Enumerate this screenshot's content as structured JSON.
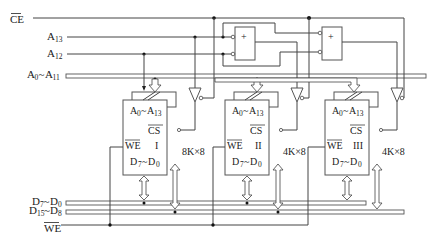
{
  "diagram": {
    "type": "memory-expansion-circuit",
    "signals": {
      "ce": "CE",
      "a13": {
        "base": "A",
        "sub": "13"
      },
      "a12": {
        "base": "A",
        "sub": "12"
      },
      "addr_bus": {
        "base1": "A",
        "sub1": "0",
        "sep": "~",
        "base2": "A",
        "sub2": "11"
      },
      "d_low": {
        "base1": "D",
        "sub1": "7",
        "sep": "~",
        "base2": "D",
        "sub2": "0"
      },
      "d_high": {
        "base1": "D",
        "sub1": "15",
        "sep": "~",
        "base2": "D",
        "sub2": "8"
      },
      "we": "WE"
    },
    "chips": [
      {
        "id": "I",
        "roman": "I",
        "size": "8K×8",
        "addr": {
          "b1": "A",
          "s1": "0",
          "sep": "~",
          "b2": "A",
          "s2": "13"
        },
        "cs": "CS",
        "we": "WE",
        "data": {
          "b1": "D",
          "s1": "7",
          "sep": "~",
          "b2": "D",
          "s2": "0"
        }
      },
      {
        "id": "II",
        "roman": "II",
        "size": "4K×8",
        "addr": {
          "b1": "A",
          "s1": "0",
          "sep": "~",
          "b2": "A",
          "s2": "13"
        },
        "cs": "CS",
        "we": "WE",
        "data": {
          "b1": "D",
          "s1": "7",
          "sep": "~",
          "b2": "D",
          "s2": "0"
        }
      },
      {
        "id": "III",
        "roman": "III",
        "size": "4K×8",
        "addr": {
          "b1": "A",
          "s1": "0",
          "sep": "~",
          "b2": "A",
          "s2": "13"
        },
        "cs": "CS",
        "we": "WE",
        "data": {
          "b1": "D",
          "s1": "7",
          "sep": "~",
          "b2": "D",
          "s2": "0"
        }
      }
    ],
    "gates": [
      {
        "id": "or-gate-1",
        "symbol": "+"
      },
      {
        "id": "or-gate-2",
        "symbol": "+"
      }
    ]
  }
}
